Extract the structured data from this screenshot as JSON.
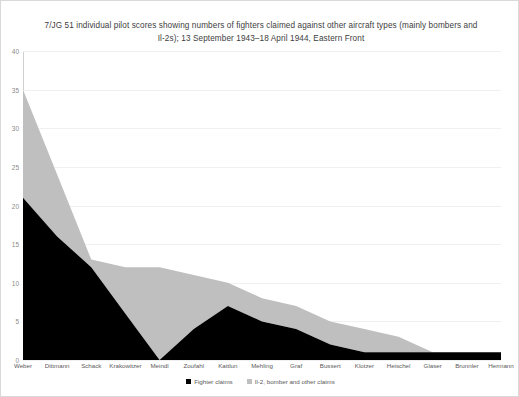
{
  "chart_data": {
    "type": "area",
    "stacked": true,
    "title": "7/JG 51 individual pilot scores showing numbers of fighters claimed against other aircraft types (mainly bombers and Il-2s); 13 September 1943–18 April 1944, Eastern Front",
    "xlabel": "",
    "ylabel": "",
    "ylim": [
      0,
      40
    ],
    "ytick_step": 5,
    "yticks": [
      0,
      5,
      10,
      15,
      20,
      25,
      30,
      35,
      40
    ],
    "grid": true,
    "legend_position": "bottom",
    "categories": [
      "Weber",
      "Dittmann",
      "Schack",
      "Krakowitzer",
      "Meindl",
      "Zoufahl",
      "Kattlun",
      "Mehling",
      "Graf",
      "Bussert",
      "Klotzer",
      "Heischel",
      "Glaser",
      "Brunnler",
      "Hermann"
    ],
    "series": [
      {
        "name": "Fighter claims",
        "color": "#000000",
        "values": [
          21,
          16,
          12,
          6,
          0,
          4,
          7,
          5,
          4,
          2,
          1,
          1,
          1,
          1,
          1
        ]
      },
      {
        "name": "Il-2, bomber and other claims",
        "color": "#bfbfbf",
        "values": [
          14,
          8,
          1,
          6,
          12,
          7,
          3,
          3,
          3,
          3,
          3,
          2,
          0,
          0,
          0
        ]
      }
    ],
    "totals": [
      35,
      24,
      13,
      12,
      12,
      11,
      10,
      8,
      7,
      5,
      4,
      3,
      1,
      1,
      1
    ]
  },
  "legend": {
    "items": [
      {
        "label": "Fighter claims",
        "color": "#000000"
      },
      {
        "label": "Il-2, bomber and other claims",
        "color": "#bfbfbf"
      }
    ]
  }
}
